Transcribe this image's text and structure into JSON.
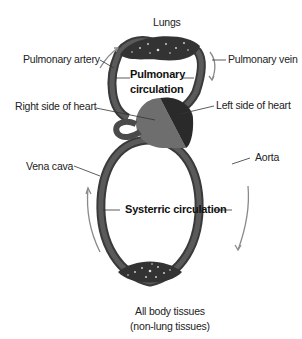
{
  "labels": {
    "lungs": "Lungs",
    "pulmonary_artery": "Pulmonary artery",
    "pulmonary_vein": "Pulmonary vein",
    "pulmonary_circulation_line1": "Pulmonary",
    "pulmonary_circulation_line2": "circulation",
    "right_heart": "Right side of heart",
    "left_heart": "Left side of heart",
    "vena_cava": "Vena cava",
    "aorta": "Aorta",
    "systemic_circulation": "Systerric circulation",
    "body_tissues_line1": "All body tissues",
    "body_tissues_line2": "(non-lung tissues)"
  },
  "colors": {
    "vessel": "#4a4a4a",
    "vessel_dark": "#2e2e2e",
    "right_heart": "#6e6e6e",
    "left_heart": "#2a2a2a",
    "arrow": "#8a8a8a",
    "leader": "#333333"
  }
}
